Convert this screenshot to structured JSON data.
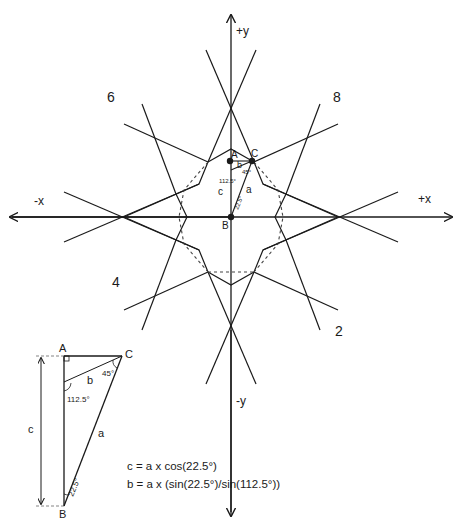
{
  "diagram": {
    "axes": {
      "pos_y": "+y",
      "neg_y": "-y",
      "pos_x": "+x",
      "neg_x": "-x"
    },
    "region_labels": {
      "top_left": "6",
      "top_right": "8",
      "bottom_left": "4",
      "bottom_right": "2"
    },
    "center_points": {
      "A": "A",
      "B": "B",
      "C": "C",
      "side_a": "a",
      "side_b": "b",
      "side_c": "c",
      "angle_112": "112.5°",
      "angle_45": "45°",
      "angle_22": "22.5°"
    },
    "detail_triangle": {
      "vertex_A": "A",
      "vertex_B": "B",
      "vertex_C": "C",
      "side_a": "a",
      "side_b": "b",
      "side_c": "c",
      "angle_at_C": "45°",
      "angle_112": "112.5°",
      "angle_at_B": "22.5°"
    },
    "formulas": {
      "c_formula": "c = a x cos(22.5°)",
      "b_formula": "b = a x (sin(22.5°)/sin(112.5°))"
    },
    "colors": {
      "line": "#1a1a1a",
      "dashed": "#444444",
      "background": "#ffffff"
    }
  }
}
